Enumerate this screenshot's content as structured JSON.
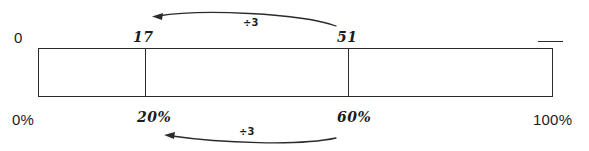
{
  "diagram": {
    "colors": {
      "ink": "#2b2b2b",
      "background": "#ffffff"
    },
    "bar": {
      "name": "percent-bar",
      "segments": [
        {
          "from_percent": "0%",
          "to_percent": "20%"
        },
        {
          "from_percent": "20%",
          "to_percent": "60%"
        },
        {
          "from_percent": "60%",
          "to_percent": "100%"
        }
      ]
    },
    "top_labels": [
      {
        "id": "zero",
        "text": "0",
        "style": "printed",
        "at_percent": "0%"
      },
      {
        "id": "seventeen",
        "text": "17",
        "style": "handwritten",
        "at_percent": "20%"
      },
      {
        "id": "fiftyone",
        "text": "51",
        "style": "handwritten",
        "at_percent": "60%"
      }
    ],
    "bottom_labels": [
      {
        "id": "zero-percent",
        "text": "0%",
        "style": "printed"
      },
      {
        "id": "twenty-percent",
        "text": "20%",
        "style": "handwritten"
      },
      {
        "id": "sixty-percent",
        "text": "60%",
        "style": "handwritten"
      },
      {
        "id": "hundred-percent",
        "text": "100%",
        "style": "printed"
      }
    ],
    "arrows": [
      {
        "id": "top-arrow",
        "operation": "÷3",
        "direction": "right-to-left",
        "from_label": "51",
        "to_label": "17"
      },
      {
        "id": "bottom-arrow",
        "operation": "÷3",
        "direction": "right-to-left",
        "from_label": "60%",
        "to_label": "20%"
      }
    ],
    "marks": [
      {
        "id": "end-dash",
        "text": "",
        "description": "short horizontal pen dash above right end of bar"
      }
    ]
  }
}
